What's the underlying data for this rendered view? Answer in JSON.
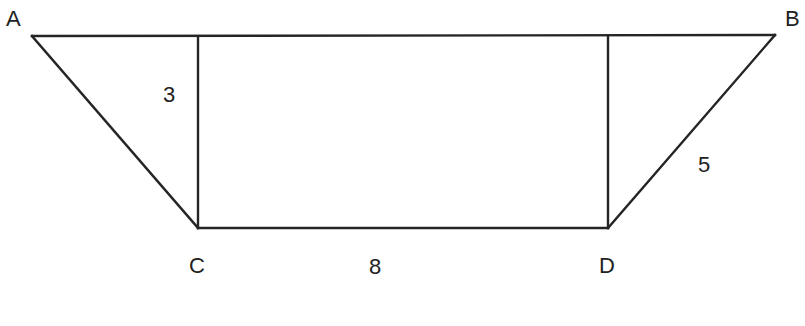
{
  "figure": {
    "background_color": "#ffffff",
    "stroke_color": "#252525",
    "text_color": "#222222",
    "stroke_width": 2,
    "vertices": [
      {
        "name": "A",
        "label": "A",
        "x": 32,
        "y": 36,
        "label_x": 6,
        "label_y": 8
      },
      {
        "name": "B",
        "label": "B",
        "x": 775,
        "y": 35,
        "label_x": 785,
        "label_y": 8
      },
      {
        "name": "C",
        "label": "C",
        "x": 198,
        "y": 228,
        "label_x": 189,
        "label_y": 255
      },
      {
        "name": "D",
        "label": "D",
        "x": 608,
        "y": 228,
        "label_x": 599,
        "label_y": 255
      }
    ],
    "edges": [
      {
        "name": "edge-AB",
        "from": "A",
        "to": "B"
      },
      {
        "name": "edge-AC",
        "from": "A",
        "to": "C"
      },
      {
        "name": "edge-CD",
        "from": "C",
        "to": "D"
      },
      {
        "name": "edge-DB",
        "from": "D",
        "to": "B"
      },
      {
        "name": "altitude-left",
        "from": "top-above-C",
        "to": "C",
        "x1": 198,
        "y1": 37,
        "x2": 198,
        "y2": 228
      },
      {
        "name": "altitude-right",
        "from": "top-above-D",
        "to": "D",
        "x1": 608,
        "y1": 36,
        "x2": 608,
        "y2": 228
      }
    ],
    "measurements": [
      {
        "name": "height-left",
        "value": "3",
        "x": 163,
        "y": 84,
        "describes": "altitude-left"
      },
      {
        "name": "base-cd",
        "value": "8",
        "x": 369,
        "y": 256,
        "describes": "edge-CD"
      },
      {
        "name": "side-db",
        "value": "5",
        "x": 698,
        "y": 154,
        "describes": "edge-DB"
      }
    ]
  }
}
